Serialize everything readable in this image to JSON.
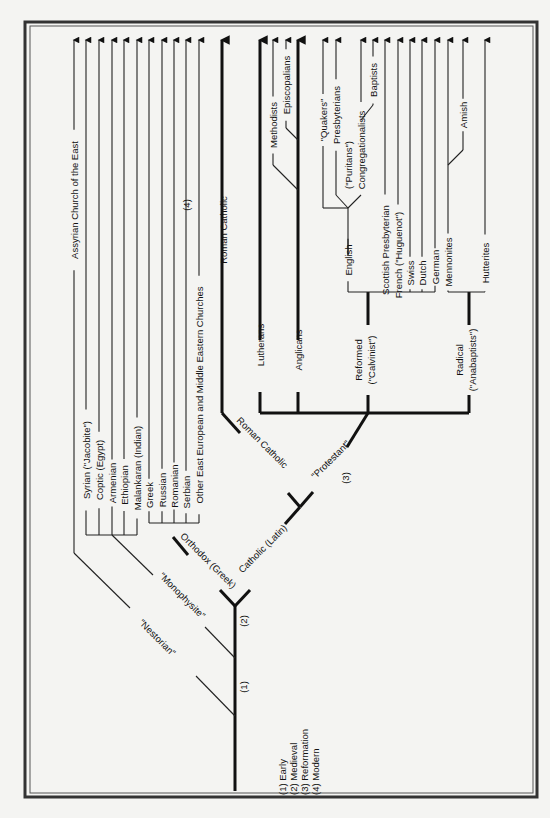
{
  "diagram": {
    "orientation": "rotated 90° counter-clockwise (time flows bottom to top)",
    "legend": {
      "items": [
        {
          "id": "1",
          "label": "(1) Early"
        },
        {
          "id": "2",
          "label": "(2) Medieval"
        },
        {
          "id": "3",
          "label": "(3) Reformation"
        },
        {
          "id": "4",
          "label": "(4) Modern"
        }
      ]
    },
    "era_markers": [
      {
        "label": "(1)",
        "x": 243,
        "y": 687
      },
      {
        "label": "(2)",
        "x": 243,
        "y": 621
      },
      {
        "label": "(3)",
        "x": 345,
        "y": 478
      },
      {
        "label": "(4)",
        "x": 186,
        "y": 205
      }
    ],
    "branch_labels": [
      {
        "label": "\"Nestorian\"",
        "x": 155,
        "y": 640,
        "angle": 45
      },
      {
        "label": "\"Monophysite\"",
        "x": 180,
        "y": 598,
        "angle": 45
      },
      {
        "label": "Orthodox (Greek)",
        "x": 206,
        "y": 563,
        "angle": 45
      },
      {
        "label": "Catholic (Latin)",
        "x": 265,
        "y": 551,
        "angle": -45
      },
      {
        "label": "Roman Catholic",
        "x": 260,
        "y": 445,
        "angle": 45
      },
      {
        "label": "\"Protestant\"",
        "x": 333,
        "y": 462,
        "angle": -45
      },
      {
        "label": "Reformed",
        "x": 362,
        "y": 360,
        "angle": -90
      },
      {
        "label": "(\"Calvinist\")",
        "x": 375,
        "y": 360,
        "angle": -90
      },
      {
        "label": "Radical",
        "x": 463,
        "y": 360,
        "angle": -90
      },
      {
        "label": "(\"Anabaptists\")",
        "x": 476,
        "y": 360,
        "angle": -90
      }
    ],
    "churches": [
      {
        "name": "Assyrian Church of the East",
        "group": "Nestorian",
        "x": 74,
        "label_y": 200
      },
      {
        "name": "Syrian (\"Jacobite\")",
        "group": "Monophysite",
        "x": 86,
        "label_y": 460
      },
      {
        "name": "Coptic (Egypt)",
        "group": "Monophysite",
        "x": 99,
        "label_y": 470
      },
      {
        "name": "Armenian",
        "group": "Monophysite",
        "x": 112,
        "label_y": 483
      },
      {
        "name": "Ethiopian",
        "group": "Monophysite",
        "x": 124,
        "label_y": 485
      },
      {
        "name": "Malankaran (Indian)",
        "group": "Monophysite",
        "x": 137,
        "label_y": 468
      },
      {
        "name": "Greek",
        "group": "Orthodox",
        "x": 149,
        "label_y": 495
      },
      {
        "name": "Russian",
        "group": "Orthodox",
        "x": 162,
        "label_y": 490
      },
      {
        "name": "Romanian",
        "group": "Orthodox",
        "x": 174,
        "label_y": 486
      },
      {
        "name": "Serbian",
        "group": "Orthodox",
        "x": 186,
        "label_y": 492
      },
      {
        "name": "Other East European and Middle Eastern Churches",
        "group": "Orthodox",
        "x": 199,
        "label_y": 395
      },
      {
        "name": "Roman Catholic",
        "group": "Roman Catholic",
        "x": 223,
        "label_y": 230
      },
      {
        "name": "Lutherans",
        "group": "Protestant",
        "x": 260,
        "label_y": 345
      },
      {
        "name": "Methodists",
        "group": "Anglican",
        "x": 273,
        "label_y": 125
      },
      {
        "name": "Episcopalians",
        "group": "Anglican",
        "x": 286,
        "label_y": 85
      },
      {
        "name": "Anglicans",
        "group": "Protestant",
        "x": 298,
        "label_y": 350
      },
      {
        "name": "\"Quakers\"",
        "group": "English Reformed",
        "x": 323,
        "label_y": 120
      },
      {
        "name": "Presbyterians",
        "group": "English Reformed",
        "x": 336,
        "label_y": 115
      },
      {
        "name": "(\"Puritans\")",
        "group": "English Reformed",
        "x": 348,
        "label_y": 165
      },
      {
        "name": "Congregationalists",
        "group": "English Reformed",
        "x": 361,
        "label_y": 150
      },
      {
        "name": "Baptists",
        "group": "English Reformed",
        "x": 373,
        "label_y": 80
      },
      {
        "name": "English",
        "group": "Reformed",
        "x": 348,
        "label_y": 260
      },
      {
        "name": "Scottish Presbyterian",
        "group": "Reformed",
        "x": 385,
        "label_y": 250
      },
      {
        "name": "French (\"Huguenot\")",
        "group": "Reformed",
        "x": 398,
        "label_y": 255
      },
      {
        "name": "Swiss",
        "group": "Reformed",
        "x": 410,
        "label_y": 273
      },
      {
        "name": "Dutch",
        "group": "Reformed",
        "x": 422,
        "label_y": 273
      },
      {
        "name": "German",
        "group": "Reformed",
        "x": 435,
        "label_y": 267
      },
      {
        "name": "Mennonites",
        "group": "Radical",
        "x": 448,
        "label_y": 262
      },
      {
        "name": "Amish",
        "group": "Mennonite",
        "x": 463,
        "label_y": 115
      },
      {
        "name": "Hutterites",
        "group": "Radical",
        "x": 485,
        "label_y": 263
      }
    ],
    "colors": {
      "background": "#f4f4f2",
      "line": "#111111",
      "frame": "#333333"
    }
  }
}
